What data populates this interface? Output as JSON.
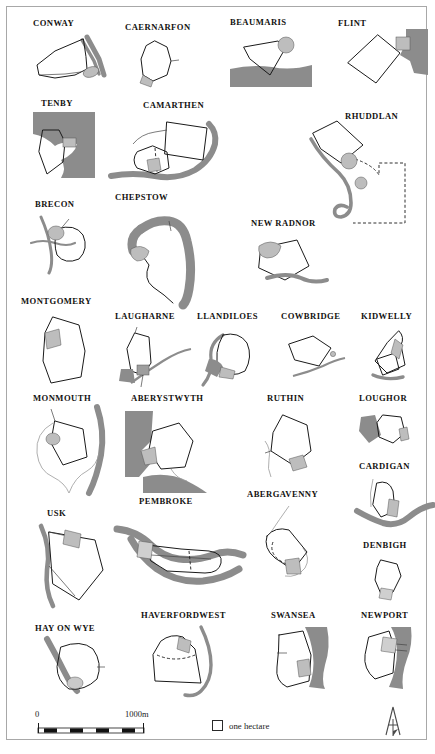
{
  "plate": {
    "title": "Medieval Welsh town plans comparative plate",
    "frame_color": "#a8a8a8",
    "background": "#ffffff"
  },
  "palette": {
    "sea": "#8c8c8c",
    "river": "#8c8c8c",
    "wall": "#1a1a1a",
    "castle_hatch": "#b5b5b5",
    "label": "#12110f"
  },
  "towns": [
    {
      "id": "conway",
      "label": "CONWAY"
    },
    {
      "id": "caernarfon",
      "label": "CAERNARFON"
    },
    {
      "id": "beaumaris",
      "label": "BEAUMARIS"
    },
    {
      "id": "flint",
      "label": "FLINT"
    },
    {
      "id": "tenby",
      "label": "TENBY"
    },
    {
      "id": "camarthen",
      "label": "CAMARTHEN"
    },
    {
      "id": "rhuddlan",
      "label": "RHUDDLAN"
    },
    {
      "id": "brecon",
      "label": "BRECON"
    },
    {
      "id": "chepstow",
      "label": "CHEPSTOW"
    },
    {
      "id": "new-radnor",
      "label": "NEW RADNOR"
    },
    {
      "id": "montgomery",
      "label": "MONTGOMERY"
    },
    {
      "id": "laugharne",
      "label": "LAUGHARNE"
    },
    {
      "id": "llandiloes",
      "label": "LLANDILOES"
    },
    {
      "id": "cowbridge",
      "label": "COWBRIDGE"
    },
    {
      "id": "kidwelly",
      "label": "KIDWELLY"
    },
    {
      "id": "monmouth",
      "label": "MONMOUTH"
    },
    {
      "id": "aberystwyth",
      "label": "ABERYSTWYTH"
    },
    {
      "id": "ruthin",
      "label": "RUTHIN"
    },
    {
      "id": "loughor",
      "label": "LOUGHOR"
    },
    {
      "id": "cardigan",
      "label": "CARDIGAN"
    },
    {
      "id": "usk",
      "label": "USK"
    },
    {
      "id": "pembroke",
      "label": "PEMBROKE"
    },
    {
      "id": "abergavenny",
      "label": "ABERGAVENNY"
    },
    {
      "id": "denbigh",
      "label": "DENBIGH"
    },
    {
      "id": "hay-on-wye",
      "label": "HAY ON WYE"
    },
    {
      "id": "haverfordwest",
      "label": "HAVERFORDWEST"
    },
    {
      "id": "swansea",
      "label": "SWANSEA"
    },
    {
      "id": "newport",
      "label": "NEWPORT"
    }
  ],
  "scale": {
    "start_label": "0",
    "end_label": "1000m"
  },
  "legend": {
    "symbol": "square-outline",
    "text": "one hectare"
  },
  "north": {
    "glyph": "N",
    "name": "north-arrow"
  }
}
